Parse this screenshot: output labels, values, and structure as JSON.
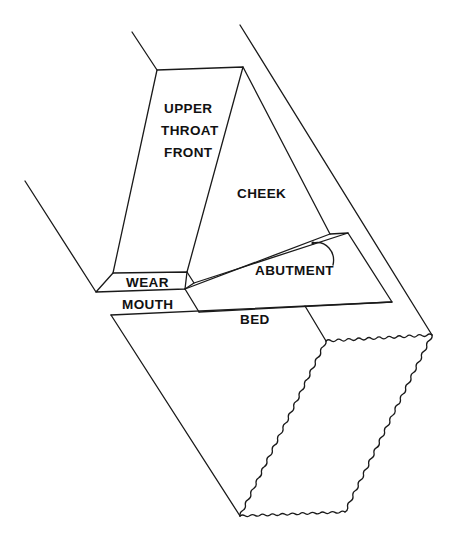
{
  "diagram": {
    "labels": {
      "upper_throat_front": [
        "UPPER",
        "THROAT",
        "FRONT"
      ],
      "cheek": "CHEEK",
      "wear": "WEAR",
      "mouth": "MOUTH",
      "abutment": "ABUTMENT",
      "bed": "BED"
    },
    "colors": {
      "line": "#1a1a1a",
      "text": "#111111",
      "background": "#ffffff"
    }
  }
}
